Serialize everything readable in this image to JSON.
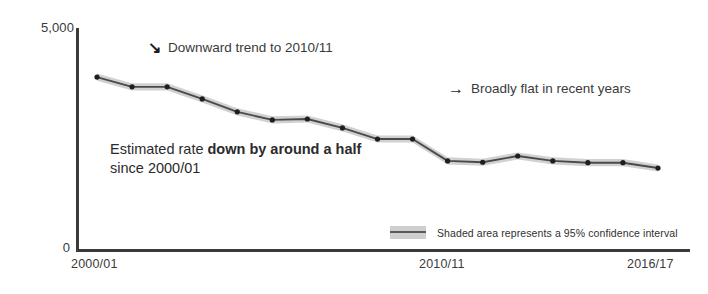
{
  "chart_data": {
    "type": "line",
    "title": "",
    "xlabel": "",
    "ylabel": "",
    "ylim": [
      0,
      5000
    ],
    "grid": false,
    "legend_position": "inside-bottom-right",
    "categories": [
      "2000/01",
      "2001/02",
      "2002/03",
      "2003/04",
      "2004/05",
      "2005/06",
      "2006/07",
      "2007/08",
      "2008/09",
      "2009/10",
      "2010/11",
      "2011/12",
      "2012/13",
      "2013/14",
      "2014/15",
      "2015/16",
      "2016/17"
    ],
    "x_tick_labels": [
      "2000/01",
      "2010/11",
      "2016/17"
    ],
    "y_tick_labels": [
      "5,000",
      "0"
    ],
    "series": [
      {
        "name": "Estimated rate",
        "values": [
          3900,
          3680,
          3680,
          3410,
          3120,
          2940,
          2960,
          2760,
          2510,
          2510,
          2020,
          1990,
          2130,
          2020,
          1980,
          1980,
          1860
        ]
      }
    ],
    "confidence_band": {
      "label": "95% confidence interval",
      "upper": [
        3980,
        3760,
        3760,
        3490,
        3200,
        3020,
        3040,
        2840,
        2590,
        2590,
        2100,
        2070,
        2210,
        2100,
        2060,
        2060,
        1940
      ],
      "lower": [
        3820,
        3600,
        3600,
        3330,
        3040,
        2860,
        2880,
        2680,
        2430,
        2430,
        1940,
        1910,
        2050,
        1940,
        1900,
        1900,
        1780
      ]
    },
    "annotations": [
      {
        "id": "downward",
        "arrow": "arrow-down-right",
        "arrow_glyph": "↘",
        "text": "Downward trend to 2010/11"
      },
      {
        "id": "flat",
        "arrow": "arrow-right",
        "arrow_glyph": "→",
        "text": "Broadly flat in recent years"
      },
      {
        "id": "half",
        "text_plain": "Estimated rate ",
        "text_bold": "down by around a half",
        "text_line2": "since 2000/01"
      }
    ],
    "legend": {
      "swatch_color": "#cfcfcf",
      "line_color": "#5a5a5a",
      "text": "Shaded area represents a 95% confidence interval"
    },
    "colors": {
      "line": "#4a4a4a",
      "band": "#cfcfcf",
      "marker": "#1e1e1e",
      "axis": "#3a3a3a",
      "text": "#2b2b2b",
      "background": "#ffffff"
    }
  }
}
